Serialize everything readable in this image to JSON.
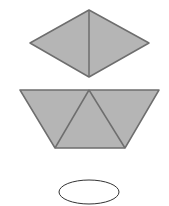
{
  "diagram": {
    "colors": {
      "fill": "#b5b5b5",
      "stroke": "#6e6e6e",
      "ellipse_stroke": "#333333",
      "background": "#ffffff"
    },
    "shapes": [
      {
        "id": "rhombus",
        "type": "rhombus made of two triangles",
        "pieces": 2
      },
      {
        "id": "trapezoid",
        "type": "trapezoid made of three triangles",
        "pieces": 3
      },
      {
        "id": "ellipse",
        "type": "empty oval answer blank",
        "pieces": 0
      }
    ]
  }
}
